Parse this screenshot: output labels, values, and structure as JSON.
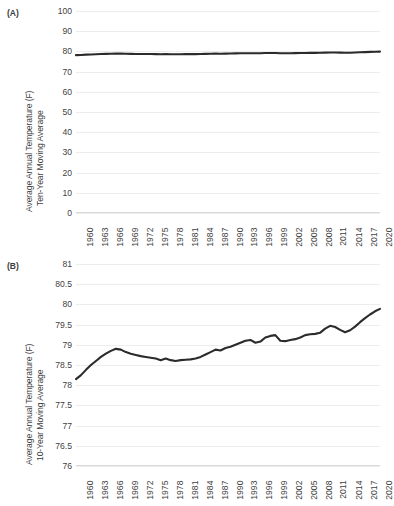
{
  "figure": {
    "panels": [
      {
        "label": "(A)",
        "ylabel_line1": "Average Annual Temperature (F)",
        "ylabel_line2": "Ten-Year Moving Average"
      },
      {
        "label": "(B)",
        "ylabel_line1": "Average Annual Temperature (F)",
        "ylabel_line2": "10-Year Moving Average"
      }
    ]
  },
  "chart_data": [
    {
      "type": "line",
      "panel": "(A)",
      "title": "",
      "xlabel": "",
      "ylabel": "Average Annual Temperature (F) Ten-Year Moving Average",
      "ylim": [
        0,
        100
      ],
      "yticks": [
        "0",
        "10",
        "20",
        "30",
        "40",
        "50",
        "60",
        "70",
        "80",
        "90",
        "100"
      ],
      "ytick_values": [
        0,
        10,
        20,
        30,
        40,
        50,
        60,
        70,
        80,
        90,
        100
      ],
      "xlim": [
        1960,
        2021
      ],
      "xticks": [
        "1960",
        "1963",
        "1966",
        "1969",
        "1972",
        "1975",
        "1978",
        "1981",
        "1984",
        "1987",
        "1990",
        "1993",
        "1996",
        "1999",
        "2002",
        "2005",
        "2008",
        "2011",
        "2014",
        "2017",
        "2020"
      ],
      "xtick_values": [
        1960,
        1963,
        1966,
        1969,
        1972,
        1975,
        1978,
        1981,
        1984,
        1987,
        1990,
        1993,
        1996,
        1999,
        2002,
        2005,
        2008,
        2011,
        2014,
        2017,
        2020
      ],
      "grid": true,
      "legend": "none",
      "x": [
        1960,
        1961,
        1962,
        1963,
        1964,
        1965,
        1966,
        1967,
        1968,
        1969,
        1970,
        1971,
        1972,
        1973,
        1974,
        1975,
        1976,
        1977,
        1978,
        1979,
        1980,
        1981,
        1982,
        1983,
        1984,
        1985,
        1986,
        1987,
        1988,
        1989,
        1990,
        1991,
        1992,
        1993,
        1994,
        1995,
        1996,
        1997,
        1998,
        1999,
        2000,
        2001,
        2002,
        2003,
        2004,
        2005,
        2006,
        2007,
        2008,
        2009,
        2010,
        2011,
        2012,
        2013,
        2014,
        2015,
        2016,
        2017,
        2018,
        2019,
        2020,
        2021
      ],
      "values": [
        78.15,
        78.25,
        78.38,
        78.5,
        78.6,
        78.7,
        78.78,
        78.85,
        78.9,
        78.88,
        78.82,
        78.78,
        78.75,
        78.72,
        78.7,
        78.68,
        78.66,
        78.62,
        78.66,
        78.62,
        78.6,
        78.62,
        78.63,
        78.64,
        78.66,
        78.7,
        78.76,
        78.82,
        78.88,
        78.86,
        78.92,
        78.95,
        79.0,
        79.05,
        79.1,
        79.12,
        79.05,
        79.08,
        79.18,
        79.22,
        79.24,
        79.1,
        79.09,
        79.12,
        79.14,
        79.18,
        79.24,
        79.26,
        79.27,
        79.3,
        79.4,
        79.47,
        79.44,
        79.37,
        79.31,
        79.36,
        79.45,
        79.56,
        79.66,
        79.75,
        79.83,
        79.89
      ]
    },
    {
      "type": "line",
      "panel": "(B)",
      "title": "",
      "xlabel": "",
      "ylabel": "Average Annual Temperature (F) 10-Year Moving Average",
      "ylim": [
        76,
        81
      ],
      "yticks": [
        "76",
        "76.5",
        "77",
        "77.5",
        "78",
        "78.5",
        "79",
        "79.5",
        "80",
        "80.5",
        "81"
      ],
      "ytick_values": [
        76,
        76.5,
        77,
        77.5,
        78,
        78.5,
        79,
        79.5,
        80,
        80.5,
        81
      ],
      "xlim": [
        1960,
        2021
      ],
      "xticks": [
        "1960",
        "1963",
        "1966",
        "1969",
        "1972",
        "1975",
        "1978",
        "1981",
        "1984",
        "1987",
        "1990",
        "1993",
        "1996",
        "1999",
        "2002",
        "2005",
        "2008",
        "2011",
        "2014",
        "2017",
        "2020"
      ],
      "xtick_values": [
        1960,
        1963,
        1966,
        1969,
        1972,
        1975,
        1978,
        1981,
        1984,
        1987,
        1990,
        1993,
        1996,
        1999,
        2002,
        2005,
        2008,
        2011,
        2014,
        2017,
        2020
      ],
      "grid": true,
      "legend": "none",
      "x": [
        1960,
        1961,
        1962,
        1963,
        1964,
        1965,
        1966,
        1967,
        1968,
        1969,
        1970,
        1971,
        1972,
        1973,
        1974,
        1975,
        1976,
        1977,
        1978,
        1979,
        1980,
        1981,
        1982,
        1983,
        1984,
        1985,
        1986,
        1987,
        1988,
        1989,
        1990,
        1991,
        1992,
        1993,
        1994,
        1995,
        1996,
        1997,
        1998,
        1999,
        2000,
        2001,
        2002,
        2003,
        2004,
        2005,
        2006,
        2007,
        2008,
        2009,
        2010,
        2011,
        2012,
        2013,
        2014,
        2015,
        2016,
        2017,
        2018,
        2019,
        2020,
        2021
      ],
      "values": [
        78.15,
        78.25,
        78.38,
        78.5,
        78.6,
        78.7,
        78.78,
        78.85,
        78.9,
        78.88,
        78.82,
        78.78,
        78.75,
        78.72,
        78.7,
        78.68,
        78.66,
        78.62,
        78.66,
        78.62,
        78.6,
        78.62,
        78.63,
        78.64,
        78.66,
        78.7,
        78.76,
        78.82,
        78.88,
        78.86,
        78.92,
        78.95,
        79.0,
        79.05,
        79.1,
        79.12,
        79.05,
        79.08,
        79.18,
        79.22,
        79.24,
        79.1,
        79.09,
        79.12,
        79.14,
        79.18,
        79.24,
        79.26,
        79.27,
        79.3,
        79.4,
        79.47,
        79.44,
        79.37,
        79.31,
        79.36,
        79.45,
        79.56,
        79.66,
        79.75,
        79.83,
        79.89
      ]
    }
  ],
  "style": {
    "line_color": "#2b2b2b",
    "grid_color": "#ededed",
    "text_color": "#3f3f3f",
    "background": "#ffffff"
  }
}
